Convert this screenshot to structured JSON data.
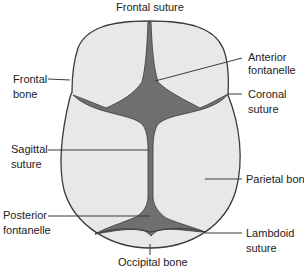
{
  "diagram": {
    "colors": {
      "bone": "#e8e8e8",
      "fontanelle": "#6f6f6f",
      "outline": "#3a3a3a",
      "text": "#222222"
    },
    "labels": {
      "frontal_suture": "Frontal suture",
      "anterior_fontanelle_1": "Anterior",
      "anterior_fontanelle_2": "fontanelle",
      "frontal_bone_1": "Frontal",
      "frontal_bone_2": "bone",
      "coronal_suture_1": "Coronal",
      "coronal_suture_2": "suture",
      "sagittal_suture_1": "Sagittal",
      "sagittal_suture_2": "suture",
      "parietal_bone": "Parietal bone",
      "posterior_fontanelle_1": "Posterior",
      "posterior_fontanelle_2": "fontanelle",
      "lambdoid_suture_1": "Lambdoid",
      "lambdoid_suture_2": "suture",
      "occipital_bone": "Occipital bone"
    }
  }
}
